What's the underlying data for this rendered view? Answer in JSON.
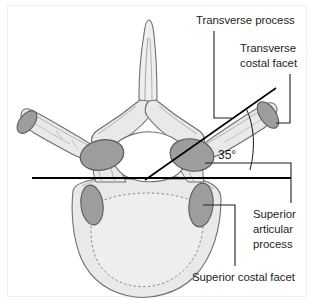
{
  "figure": {
    "background_color": "#ffffff",
    "frame_color": "#f1f1f1"
  },
  "colors": {
    "bone_fill": "#e9e9e9",
    "bone_fill_light": "#efefef",
    "bone_outline": "#6f6f6f",
    "facet_fill": "#9d9d9d",
    "facet_outline": "#5a5a5a",
    "foramen_fill": "#ffffff",
    "leader_line": "#231f20",
    "axis_line": "#000000",
    "text": "#231f20",
    "dashed_contour": "#8a8a8a"
  },
  "labels": [
    {
      "id": "transverse-process",
      "text": "Transverse process",
      "x": 196,
      "y": 24,
      "anchor": "start"
    },
    {
      "id": "transverse-costal-facet-line1",
      "text": "Transverse",
      "x": 240,
      "y": 52,
      "anchor": "start"
    },
    {
      "id": "transverse-costal-facet-line2",
      "text": "costal facet",
      "x": 240,
      "y": 67,
      "anchor": "start"
    },
    {
      "id": "superior-articular-process-line1",
      "text": "Superior",
      "x": 253,
      "y": 218,
      "anchor": "start"
    },
    {
      "id": "superior-articular-process-line2",
      "text": "articular",
      "x": 253,
      "y": 233,
      "anchor": "start"
    },
    {
      "id": "superior-articular-process-line3",
      "text": "process",
      "x": 253,
      "y": 248,
      "anchor": "start"
    },
    {
      "id": "superior-costal-facet",
      "text": "Superior costal facet",
      "x": 192,
      "y": 281,
      "anchor": "start"
    }
  ],
  "annotations": {
    "angle": {
      "value": "35°",
      "x": 218,
      "y": 159,
      "description": "Angle between horizontal reference axis and transverse process axis"
    }
  },
  "structures": [
    {
      "id": "spinous-process",
      "name": "Spinous process"
    },
    {
      "id": "left-transverse-process",
      "name": "Left transverse process"
    },
    {
      "id": "right-transverse-process",
      "name": "Right transverse process"
    },
    {
      "id": "left-transverse-costal-facet",
      "name": "Left transverse costal facet"
    },
    {
      "id": "right-transverse-costal-facet",
      "name": "Right transverse costal facet"
    },
    {
      "id": "left-superior-articular-facet",
      "name": "Left superior articular facet"
    },
    {
      "id": "right-superior-articular-facet",
      "name": "Right superior articular facet"
    },
    {
      "id": "left-superior-costal-facet",
      "name": "Left superior costal facet"
    },
    {
      "id": "right-superior-costal-facet",
      "name": "Right superior costal facet"
    },
    {
      "id": "vertebral-foramen",
      "name": "Vertebral foramen"
    },
    {
      "id": "vertebral-body",
      "name": "Vertebral body"
    },
    {
      "id": "lamina",
      "name": "Lamina"
    },
    {
      "id": "pedicle",
      "name": "Pedicle"
    }
  ]
}
